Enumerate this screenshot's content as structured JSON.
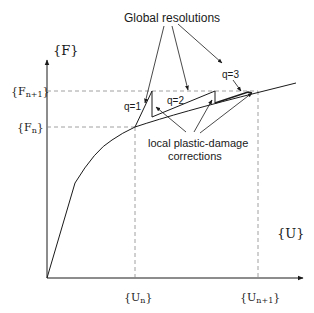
{
  "diagram": {
    "title": "Global resolutions",
    "y_axis_label": "{F}",
    "x_axis_label": "{U}",
    "y_ticks": [
      {
        "base": "F",
        "sub": "n+1"
      },
      {
        "base": "F",
        "sub": "n"
      }
    ],
    "x_ticks": [
      {
        "base": "U",
        "sub": "n"
      },
      {
        "base": "U",
        "sub": "n+1"
      }
    ],
    "iterations": [
      "q=1",
      "q=2",
      "q=3"
    ],
    "annotation_line1": "local plastic-damage",
    "annotation_line2": "corrections",
    "line_color": "#1a1a1a",
    "dash_color": "#888888"
  }
}
